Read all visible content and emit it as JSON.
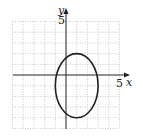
{
  "chart_data": {
    "type": "line",
    "title": "",
    "xlabel": "x",
    "ylabel": "y",
    "xlim": [
      -5,
      5
    ],
    "ylim": [
      -5,
      5
    ],
    "grid": true,
    "x_tick_labels": [
      "5"
    ],
    "y_tick_labels": [
      "5"
    ],
    "series": [
      {
        "name": "ellipse",
        "shape": "ellipse",
        "center": [
          1,
          -1
        ],
        "semi_axis_x": 2,
        "semi_axis_y": 3,
        "equation": "(x-1)^2/4 + (y+1)^2/9 = 1"
      }
    ]
  },
  "labels": {
    "x_axis": "x",
    "y_axis": "y",
    "x_tick": "5",
    "y_tick": "5"
  },
  "colors": {
    "curve": "#222222",
    "axis": "#222222",
    "grid": "#bbbbbb"
  }
}
